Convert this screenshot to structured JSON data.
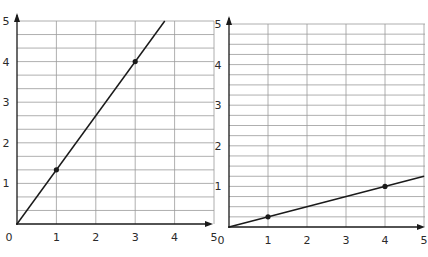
{
  "chart_data": [
    {
      "type": "line",
      "title": "",
      "xlabel": "",
      "ylabel": "",
      "xlim": [
        0,
        5
      ],
      "ylim": [
        0,
        5
      ],
      "grid": true,
      "x_ticks": [
        "0",
        "1",
        "2",
        "3",
        "4",
        "5"
      ],
      "y_ticks": [
        "1",
        "2",
        "3",
        "4",
        "5"
      ],
      "minor_y_divisions_per_unit": 3,
      "series": [
        {
          "name": "line-a",
          "x": [
            0,
            3.75
          ],
          "y": [
            0,
            5
          ],
          "slope": 1.3333
        }
      ],
      "points": [
        {
          "x": 1,
          "y": 1.3333
        },
        {
          "x": 3,
          "y": 4
        }
      ]
    },
    {
      "type": "line",
      "title": "",
      "xlabel": "",
      "ylabel": "",
      "xlim": [
        0,
        5
      ],
      "ylim": [
        0,
        5
      ],
      "grid": true,
      "x_ticks": [
        "0",
        "1",
        "2",
        "3",
        "4",
        "5"
      ],
      "y_ticks": [
        "1",
        "2",
        "3",
        "4",
        "5"
      ],
      "minor_y_divisions_per_unit": 4,
      "series": [
        {
          "name": "line-b",
          "x": [
            0,
            5
          ],
          "y": [
            0,
            1.25
          ],
          "slope": 0.25
        }
      ],
      "points": [
        {
          "x": 1,
          "y": 0.25
        },
        {
          "x": 4,
          "y": 1
        }
      ]
    }
  ],
  "colors": {
    "grid": "#9a9a9a",
    "axis": "#1a1a1a",
    "line": "#1a1a1a",
    "text": "#2a2a2a"
  }
}
